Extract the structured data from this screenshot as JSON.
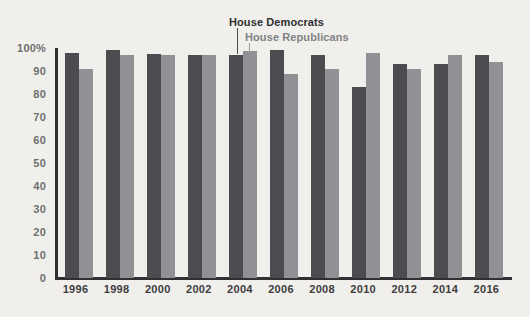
{
  "chart_data": {
    "type": "bar",
    "title": "",
    "subtitle": "",
    "xlabel": "",
    "ylabel": "",
    "ylim": [
      0,
      100
    ],
    "grid": false,
    "legend_position": "top-center-annotation",
    "categories": [
      "1996",
      "1998",
      "2000",
      "2002",
      "2004",
      "2006",
      "2008",
      "2010",
      "2012",
      "2014",
      "2016"
    ],
    "y_ticks": [
      "0",
      "10",
      "20",
      "30",
      "40",
      "50",
      "60",
      "70",
      "80",
      "90",
      "100%"
    ],
    "y_tick_values": [
      0,
      10,
      20,
      30,
      40,
      50,
      60,
      70,
      80,
      90,
      100
    ],
    "series": [
      {
        "name": "House Democrats",
        "color": "#4a4c4f",
        "values": [
          98,
          99,
          97.5,
          97,
          97,
          99,
          97,
          83,
          93,
          93,
          97
        ]
      },
      {
        "name": "House Republicans",
        "color": "#8f9194",
        "values": [
          91,
          97,
          97,
          97,
          98.5,
          88.5,
          91,
          98,
          91,
          97,
          94
        ]
      }
    ],
    "annotations": [
      {
        "text": "House Democrats",
        "target_category": "2004",
        "target_series": "House Democrats"
      },
      {
        "text": "House Republicans",
        "target_category": "2004",
        "target_series": "House Republicans"
      }
    ]
  },
  "colors": {
    "background": "#f1efeb",
    "democrat": "#4a4c4f",
    "republican": "#8f9194",
    "axis": "#2f3032",
    "y_tick_text": "#6e6f71",
    "x_tick_text": "#3c3d3f"
  }
}
